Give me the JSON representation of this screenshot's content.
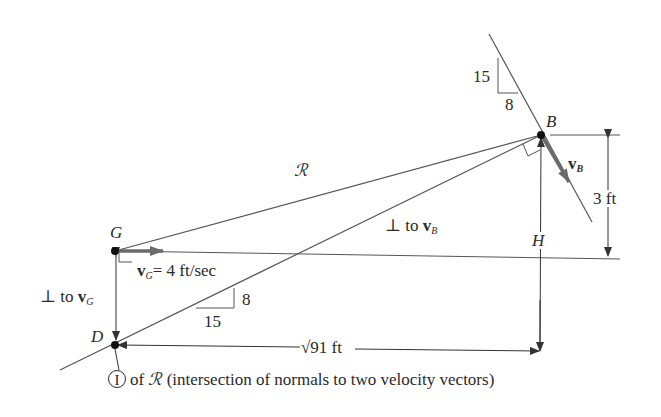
{
  "diagram": {
    "points": {
      "B": "B",
      "G": "G",
      "D": "D"
    },
    "labels": {
      "slope_top_rise": "15",
      "slope_top_run": "8",
      "slope_bottom_rise": "8",
      "slope_bottom_run": "15",
      "R_symbol": "ℛ",
      "perp_to_vB": "⊥ to",
      "vB_symbol": "v",
      "vB_sub": "B",
      "vG_symbol": "v",
      "vG_sub": "G",
      "vG_eq": "= 4 ft/sec",
      "perp_to_vG": "⊥ to",
      "H_label": "H",
      "height_3ft": "3 ft",
      "dist_sqrt91": "√91 ft",
      "ic_marker": "I",
      "caption_of": "of",
      "caption_rest": "(intersection of normals to two velocity vectors)"
    },
    "colors": {
      "line": "#555555",
      "vector": "#6a6a6a",
      "text": "#2a2a2a"
    }
  }
}
